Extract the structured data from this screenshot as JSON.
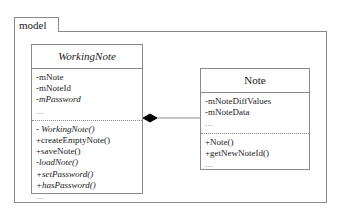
{
  "diagram": {
    "type": "uml-class-diagram",
    "package": {
      "name": "model"
    },
    "classes": [
      {
        "id": "workingnote",
        "name": "WorkingNote",
        "abstract": true,
        "attributes": [
          {
            "text": "-mNote",
            "italic": false
          },
          {
            "text": "-mNoteId",
            "italic": false
          },
          {
            "text": "-mPassword",
            "italic": true
          }
        ],
        "attributes_ellipsis": "...",
        "operations": [
          {
            "text": "- WorkingNote()",
            "italic": true
          },
          {
            "text": "+createEmptyNote()",
            "italic": false
          },
          {
            "text": "+saveNote()",
            "italic": false
          },
          {
            "text": "-loadNote()",
            "italic": true
          },
          {
            "text": "+setPassword()",
            "italic": true
          },
          {
            "text": "+hasPassword()",
            "italic": true
          }
        ],
        "operations_ellipsis": "..."
      },
      {
        "id": "note",
        "name": "Note",
        "abstract": false,
        "attributes": [
          {
            "text": "-mNoteDiffValues",
            "italic": false
          },
          {
            "text": "-mNoteData",
            "italic": false
          }
        ],
        "attributes_ellipsis": "...",
        "operations": [
          {
            "text": "+Note()",
            "italic": false
          },
          {
            "text": "+getNewNoteId()",
            "italic": false
          }
        ],
        "operations_ellipsis": "..."
      }
    ],
    "relationships": [
      {
        "kind": "composition",
        "from": "workingnote",
        "to": "note",
        "diamond_filled": true
      }
    ],
    "colors": {
      "line": "#8a8a8a",
      "text": "#1a1a1a",
      "diamond": "#000000",
      "background": "#ffffff"
    }
  }
}
